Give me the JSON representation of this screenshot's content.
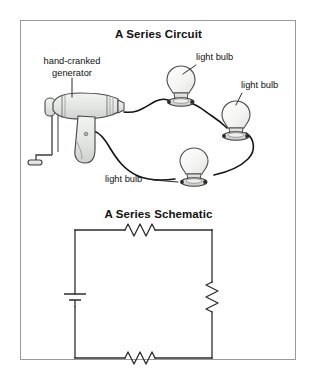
{
  "figure": {
    "border_color": "#9a9a9a",
    "background": "#ffffff"
  },
  "panels": [
    {
      "id": "series-circuit",
      "title": "A Series Circuit"
    },
    {
      "id": "series-schematic",
      "title": "A Series Schematic"
    }
  ],
  "circuit_panel": {
    "title": "A Series Circuit",
    "labels": {
      "generator": "hand-cranked\ngenerator",
      "generator_line1": "hand-cranked",
      "generator_line2": "generator",
      "bulb_top": "light bulb",
      "bulb_right": "light bulb",
      "bulb_bottom": "light bulb"
    },
    "components": {
      "generator_fill": "#e3e5e3",
      "generator_stroke": "#4a4a4a",
      "bulb_glass_fill": "#f4f4f2",
      "bulb_base_fill": "#d8d9d6",
      "wire_color": "#1a1a1a",
      "leader_color": "#2a2a2a"
    }
  },
  "schematic_panel": {
    "title": "A Series Schematic",
    "components": {
      "wire_color": "#2d2d2d",
      "resistor_count": 3,
      "battery_count": 1,
      "resistor_positions": [
        "top",
        "right",
        "bottom"
      ],
      "battery_position": "left"
    }
  },
  "icons": {
    "generator": "hand-cranked-generator-icon",
    "bulb": "light-bulb-icon",
    "resistor": "resistor-icon",
    "battery": "battery-icon"
  }
}
